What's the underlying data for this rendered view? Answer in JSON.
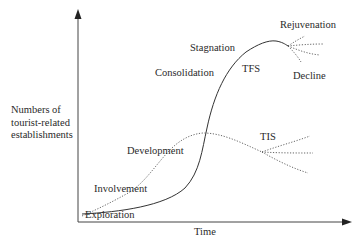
{
  "diagram": {
    "type": "tourism-area-life-cycle",
    "axes": {
      "x_label": "Time",
      "y_label_lines": [
        "Numbers of",
        "tourist-related",
        "establishments"
      ]
    },
    "stages": [
      {
        "label": "Exploration"
      },
      {
        "label": "Involvement"
      },
      {
        "label": "Development"
      },
      {
        "label": "Consolidation"
      },
      {
        "label": "Stagnation"
      },
      {
        "label": "Rejuvenation"
      },
      {
        "label": "Decline"
      }
    ],
    "curves": [
      {
        "label": "TFS",
        "style": "solid"
      },
      {
        "label": "TIS",
        "style": "dotted"
      }
    ],
    "colors": {
      "line": "#333333",
      "text": "#2a2a2a",
      "background": "#ffffff"
    }
  }
}
